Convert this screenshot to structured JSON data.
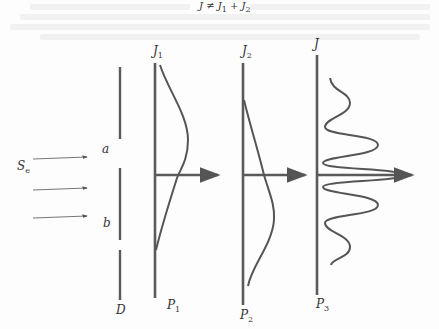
{
  "title": {
    "text": "J ≠ J",
    "sub1": "1",
    "plus": " + J",
    "sub2": "2"
  },
  "source": {
    "label": "S",
    "sub": "e",
    "arrows": 3
  },
  "barrier": {
    "label": "D",
    "slit_a": "a",
    "slit_b": "b"
  },
  "screens": [
    {
      "top_label": "J",
      "top_sub": "1",
      "bottom_label": "P",
      "bottom_sub": "1",
      "pattern": "single-slit-a"
    },
    {
      "top_label": "J",
      "top_sub": "2",
      "bottom_label": "P",
      "bottom_sub": "2",
      "pattern": "single-slit-b"
    },
    {
      "top_label": "J",
      "top_sub": "",
      "bottom_label": "P",
      "bottom_sub": "3",
      "pattern": "double-slit-interference"
    }
  ],
  "colors": {
    "line": "#5a5a5a",
    "curve": "#555555",
    "text": "#333333"
  }
}
